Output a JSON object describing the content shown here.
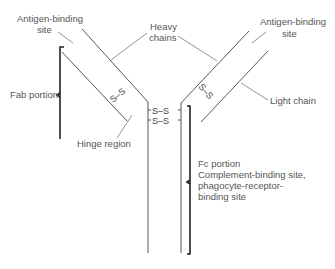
{
  "diagram": {
    "labels": {
      "antigen_left_1": "Antigen-binding",
      "antigen_left_2": "site",
      "heavy_1": "Heavy",
      "heavy_2": "chains",
      "antigen_right_1": "Antigen-binding",
      "antigen_right_2": "site",
      "fab": "Fab portion",
      "light": "Light chain",
      "hinge": "Hinge region",
      "fc_1": "Fc portion",
      "fc_2": "Complement-binding site,",
      "fc_3": "phagocyte-receptor-",
      "fc_4": "binding site"
    },
    "disulfide": {
      "bond": "S–S",
      "s": "S",
      "dash": "–"
    },
    "colors": {
      "line": "#444444",
      "text": "#555555",
      "bracket": "#222222",
      "background": "#ffffff"
    }
  }
}
